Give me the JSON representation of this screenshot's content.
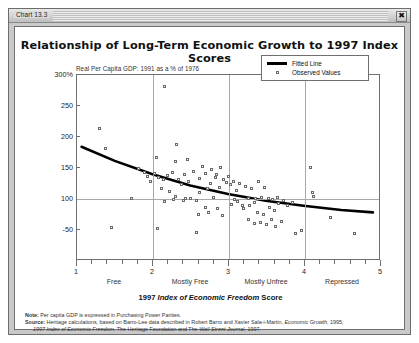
{
  "window": {
    "title": "Chart 13.3",
    "close_glyph": "✖"
  },
  "chart_data": {
    "type": "scatter",
    "title": "Relationship of Long-Term Economic Growth to 1997 Index Scores",
    "subtitle": "Real Per Capita GDP: 1991 as a % of 1976",
    "xlabel_plain": "1997 ",
    "xlabel_italic": "Index of Economic Freedom",
    "xlabel_tail": " Score",
    "ylabel": "",
    "xlim": [
      1,
      5
    ],
    "ylim": [
      0,
      300
    ],
    "grid": true,
    "legend_position": "top-right",
    "y_ticks": [
      "300%",
      "250",
      "200",
      "150",
      "100",
      "-50"
    ],
    "y_tick_values": [
      300,
      250,
      200,
      150,
      100,
      50
    ],
    "x_ticks": [
      "1",
      "2",
      "3",
      "4",
      "5"
    ],
    "x_categories": [
      {
        "label": "Free",
        "center": 1.5
      },
      {
        "label": "Mostly Free",
        "center": 2.5
      },
      {
        "label": "Mostly Unfree",
        "center": 3.5
      },
      {
        "label": "Repressed",
        "center": 4.5
      }
    ],
    "legend": [
      {
        "name": "Fitted Line",
        "marker": "line"
      },
      {
        "name": "Observed Values",
        "marker": "square"
      }
    ],
    "series": [
      {
        "name": "Observed Values",
        "points": [
          [
            1.3,
            213
          ],
          [
            1.38,
            181
          ],
          [
            2.16,
            280
          ],
          [
            2.05,
            166
          ],
          [
            2.32,
            187
          ],
          [
            2.46,
            163
          ],
          [
            2.3,
            159
          ],
          [
            1.98,
            128
          ],
          [
            2.12,
            116
          ],
          [
            2.22,
            112
          ],
          [
            2.3,
            104
          ],
          [
            2.38,
            122
          ],
          [
            2.28,
            98
          ],
          [
            2.41,
            97
          ],
          [
            2.16,
            95
          ],
          [
            2.5,
            100
          ],
          [
            2.58,
            96
          ],
          [
            2.62,
            109
          ],
          [
            2.72,
            116
          ],
          [
            2.78,
            146
          ],
          [
            2.66,
            152
          ],
          [
            2.83,
            134
          ],
          [
            2.9,
            150
          ],
          [
            2.97,
            126
          ],
          [
            2.88,
            118
          ],
          [
            3.02,
            122
          ],
          [
            3.1,
            113
          ],
          [
            2.6,
            75
          ],
          [
            2.7,
            86
          ],
          [
            2.74,
            78
          ],
          [
            2.86,
            84
          ],
          [
            2.92,
            72
          ],
          [
            3.04,
            90
          ],
          [
            3.12,
            95
          ],
          [
            3.18,
            88
          ],
          [
            3.26,
            100
          ],
          [
            3.34,
            93
          ],
          [
            1.82,
            148
          ],
          [
            1.9,
            142
          ],
          [
            1.94,
            136
          ],
          [
            2.02,
            140
          ],
          [
            2.08,
            134
          ],
          [
            2.14,
            131
          ],
          [
            2.2,
            137
          ],
          [
            2.26,
            142
          ],
          [
            2.34,
            130
          ],
          [
            2.42,
            139
          ],
          [
            2.48,
            128
          ],
          [
            2.54,
            144
          ],
          [
            2.62,
            133
          ],
          [
            2.7,
            141
          ],
          [
            2.76,
            125
          ],
          [
            2.84,
            138
          ],
          [
            2.94,
            130
          ],
          [
            3.0,
            135
          ],
          [
            3.06,
            127
          ],
          [
            3.14,
            124
          ],
          [
            3.22,
            120
          ],
          [
            3.3,
            116
          ],
          [
            3.4,
            128
          ],
          [
            3.48,
            118
          ],
          [
            2.44,
            100
          ],
          [
            2.8,
            101
          ],
          [
            3.08,
            99
          ],
          [
            3.36,
            100
          ],
          [
            3.44,
            101
          ],
          [
            3.52,
            100
          ],
          [
            3.58,
            99
          ],
          [
            3.64,
            101
          ],
          [
            3.2,
            84
          ],
          [
            3.28,
            88
          ],
          [
            3.38,
            78
          ],
          [
            3.46,
            74
          ],
          [
            3.54,
            86
          ],
          [
            3.6,
            80
          ],
          [
            3.66,
            92
          ],
          [
            3.72,
            96
          ],
          [
            3.78,
            88
          ],
          [
            3.84,
            94
          ],
          [
            3.42,
            62
          ],
          [
            3.5,
            58
          ],
          [
            3.56,
            66
          ],
          [
            3.62,
            55
          ],
          [
            3.7,
            63
          ],
          [
            3.26,
            66
          ],
          [
            3.34,
            60
          ],
          [
            1.72,
            100
          ],
          [
            4.08,
            150
          ],
          [
            4.1,
            110
          ],
          [
            4.12,
            104
          ],
          [
            4.34,
            70
          ],
          [
            4.66,
            43
          ],
          [
            3.88,
            44
          ],
          [
            2.58,
            45
          ],
          [
            3.96,
            48
          ],
          [
            1.46,
            54
          ],
          [
            2.06,
            52
          ]
        ]
      },
      {
        "name": "Fitted Line",
        "type": "line",
        "points": [
          [
            1.06,
            183
          ],
          [
            1.5,
            160
          ],
          [
            2.0,
            138
          ],
          [
            2.5,
            120
          ],
          [
            3.0,
            106
          ],
          [
            3.5,
            95
          ],
          [
            4.0,
            87
          ],
          [
            4.5,
            80
          ],
          [
            4.92,
            76
          ]
        ]
      }
    ],
    "note_label": "Note:",
    "note_text": " Per capita GDP is expressed in Purchasing Power Parities.",
    "source_label": "Source:",
    "source_text_1": " Heritage calculations, based on Barro-Lee data described in Robert Barro and Xavier Sala-i-Martin, ",
    "source_italic_1": "Economic Growth,",
    "source_text_2": " 1995;",
    "source_italic_2": "1997 Index of Economic Freedom,",
    "source_text_3": " The Heritage Foundation and The ",
    "source_italic_3": "Wall Street Journal,",
    "source_text_4": " 1997."
  }
}
